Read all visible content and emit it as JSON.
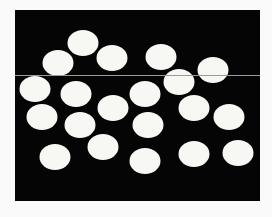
{
  "image": {
    "width": 272,
    "height": 217,
    "background_color": "#fafafa"
  },
  "panel": {
    "x": 15,
    "y": 10,
    "width": 245,
    "height": 191,
    "color": "#050505"
  },
  "scan_line": {
    "x1": 15,
    "x2": 260,
    "y": 75.5,
    "color": "#9a9a9a",
    "stroke_width": 1
  },
  "circle_style": {
    "fill": "#f7f7f4",
    "rx": 15.5,
    "ry": 13
  },
  "circles": [
    {
      "id": "A",
      "cx": 83,
      "cy": 43
    },
    {
      "id": "B",
      "cx": 58,
      "cy": 63
    },
    {
      "id": "C",
      "cx": 112,
      "cy": 58
    },
    {
      "id": "D",
      "cx": 161,
      "cy": 57
    },
    {
      "id": "E",
      "cx": 213,
      "cy": 70
    },
    {
      "id": "F",
      "cx": 179,
      "cy": 82
    },
    {
      "id": "G",
      "cx": 35,
      "cy": 89
    },
    {
      "id": "H",
      "cx": 76,
      "cy": 94
    },
    {
      "id": "I",
      "cx": 113,
      "cy": 108
    },
    {
      "id": "L",
      "cx": 145,
      "cy": 94
    },
    {
      "id": "M",
      "cx": 194,
      "cy": 108
    },
    {
      "id": "N",
      "cx": 229,
      "cy": 117
    },
    {
      "id": "J",
      "cx": 42,
      "cy": 117
    },
    {
      "id": "K",
      "cx": 80,
      "cy": 125
    },
    {
      "id": "O",
      "cx": 148,
      "cy": 125
    },
    {
      "id": "Q",
      "cx": 103,
      "cy": 147
    },
    {
      "id": "P",
      "cx": 55,
      "cy": 157
    },
    {
      "id": "R",
      "cx": 145,
      "cy": 161
    },
    {
      "id": "S",
      "cx": 194,
      "cy": 154
    },
    {
      "id": "T",
      "cx": 238,
      "cy": 153
    }
  ]
}
